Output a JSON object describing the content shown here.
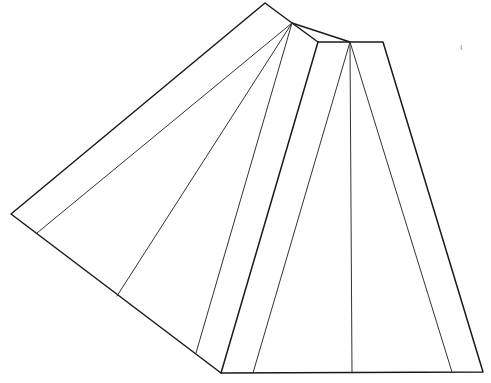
{
  "diagram": {
    "stroke_color": "#1a1a1a",
    "background": "#ffffff",
    "marks": {
      "top_right_tick": "ı"
    }
  }
}
